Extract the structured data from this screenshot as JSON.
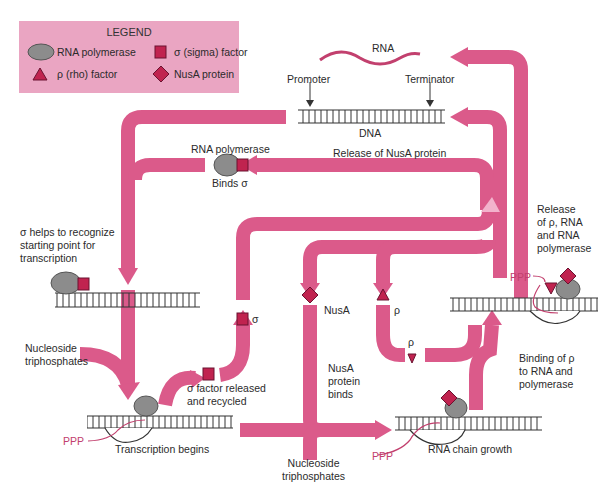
{
  "diagram_title": "Transcription cycle in bacteria",
  "colors": {
    "arrow": "#db5a8a",
    "arrow_light": "#f2b3cc",
    "factor": "#c0234f",
    "polymerase": "#8c8c8c",
    "legend_bg": "#eaa5c2",
    "rna_strand": "#c2406e"
  },
  "legend": {
    "title": "LEGEND",
    "items": [
      {
        "icon": "gray-oval",
        "label": "RNA polymerase"
      },
      {
        "icon": "red-square",
        "label": "σ (sigma) factor"
      },
      {
        "icon": "red-triangle",
        "label": "ρ (rho) factor"
      },
      {
        "icon": "red-diamond",
        "label": "NusA protein"
      }
    ]
  },
  "labels": {
    "rna": "RNA",
    "promoter": "Promoter",
    "terminator": "Terminator",
    "dna": "DNA",
    "rna_polymerase": "RNA polymerase",
    "binds_sigma": "Binds σ",
    "release_nusa": "Release of NusA protein",
    "sigma_helps": [
      "σ helps to recognize",
      "starting point for",
      "transcription"
    ],
    "release_rho": [
      "Release",
      "of ρ, RNA",
      "and RNA",
      "polymerase"
    ],
    "sigma": "σ",
    "nusa": "NusA",
    "rho": "ρ",
    "rho_small": "ρ",
    "nucleoside_1": [
      "Nucleoside",
      "triphosphates"
    ],
    "sigma_released": [
      "σ factor released",
      "and recycled"
    ],
    "nusa_binds": [
      "NusA",
      "protein",
      "binds"
    ],
    "binding_rho": [
      "Binding of ρ",
      "to RNA and",
      "polymerase"
    ],
    "transcription_begins": "Transcription begins",
    "rna_chain_growth": "RNA chain growth",
    "nucleoside_2": [
      "Nucleoside",
      "triphosphates"
    ],
    "ppp": "PPP"
  }
}
